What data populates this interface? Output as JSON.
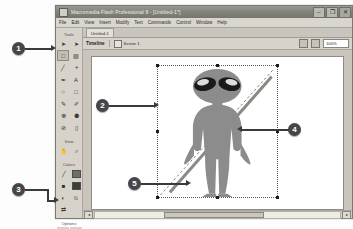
{
  "window": {
    "title": "Macromedia Flash Professional 8 - [Untitled-1*]",
    "app_icon": "flash-app-icon",
    "controls": {
      "minimize": "–",
      "restore": "❐",
      "close": "✕"
    }
  },
  "menubar": {
    "items": [
      {
        "label": "File"
      },
      {
        "label": "Edit"
      },
      {
        "label": "View"
      },
      {
        "label": "Insert"
      },
      {
        "label": "Modify"
      },
      {
        "label": "Text"
      },
      {
        "label": "Commands"
      },
      {
        "label": "Control"
      },
      {
        "label": "Window"
      },
      {
        "label": "Help"
      }
    ]
  },
  "tools_panel": {
    "sections": [
      {
        "label": "Tools",
        "tools": [
          {
            "name": "selection-tool",
            "glyph": "➤",
            "selected": false
          },
          {
            "name": "subselection-tool",
            "glyph": "➤",
            "selected": false
          },
          {
            "name": "free-transform-tool",
            "glyph": "□",
            "selected": true
          },
          {
            "name": "gradient-transform-tool",
            "glyph": "▨",
            "selected": false
          },
          {
            "name": "line-tool",
            "glyph": "╱",
            "selected": false
          },
          {
            "name": "lasso-tool",
            "glyph": "ⰰ",
            "selected": false
          },
          {
            "name": "pen-tool",
            "glyph": "✒",
            "selected": false
          },
          {
            "name": "text-tool",
            "glyph": "A",
            "selected": false
          },
          {
            "name": "oval-tool",
            "glyph": "○",
            "selected": false
          },
          {
            "name": "rectangle-tool",
            "glyph": "□",
            "selected": false
          },
          {
            "name": "pencil-tool",
            "glyph": "✎",
            "selected": false
          },
          {
            "name": "brush-tool",
            "glyph": "✐",
            "selected": false
          },
          {
            "name": "ink-bottle-tool",
            "glyph": "☸",
            "selected": false
          },
          {
            "name": "paint-bucket-tool",
            "glyph": "⚉",
            "selected": false
          },
          {
            "name": "eyedropper-tool",
            "glyph": "⊘",
            "selected": false
          },
          {
            "name": "eraser-tool",
            "glyph": "▯",
            "selected": false
          }
        ]
      },
      {
        "label": "View",
        "tools": [
          {
            "name": "hand-tool",
            "glyph": "✋",
            "selected": false
          },
          {
            "name": "zoom-tool",
            "glyph": "⌕",
            "selected": false
          }
        ]
      },
      {
        "label": "Colors",
        "tools": [
          {
            "name": "stroke-color-pencil-icon",
            "glyph": "╱",
            "selected": false
          },
          {
            "name": "fill-color-bucket-icon",
            "glyph": "■",
            "selected": false
          },
          {
            "name": "black-and-white-icon",
            "glyph": "◐",
            "selected": false
          },
          {
            "name": "no-color-icon",
            "glyph": "⍉",
            "selected": false
          },
          {
            "name": "swap-colors-icon",
            "glyph": "⇄",
            "selected": false
          }
        ]
      },
      {
        "label": "Options",
        "tools": [
          {
            "name": "snap-to-objects-option",
            "glyph": "⬚",
            "selected": false
          },
          {
            "name": "rotate-and-skew-option",
            "glyph": "↻",
            "selected": false
          },
          {
            "name": "scale-option",
            "glyph": "⬌",
            "selected": false
          },
          {
            "name": "distort-option",
            "glyph": "◱",
            "selected": false
          },
          {
            "name": "envelope-option",
            "glyph": "▦",
            "selected": false
          }
        ]
      }
    ],
    "colors": {
      "stroke": "#6f6f69",
      "fill": "#3d3d39"
    }
  },
  "document": {
    "tab_label": "Untitled-1",
    "timeline_label": "Timeline",
    "scene_label": "Scene 1",
    "scene_icon": "scene-icon",
    "edit_scene_icon": "edit-scene-icon",
    "edit_symbols_icon": "edit-symbols-icon",
    "zoom_value": "100%"
  },
  "stage": {
    "selected_object": "alien-character",
    "alien_body_color": "#8c8c8c",
    "alien_eye_color": "#1a1a1a",
    "selection_border_color": "#5a5a55",
    "handle_color": "#1c1c1a"
  },
  "scrollbar": {
    "left_arrow": "◂",
    "right_arrow": "▸"
  },
  "callouts": [
    {
      "number": "1",
      "target": "tools-panel-top"
    },
    {
      "number": "2",
      "target": "selected-alien-object"
    },
    {
      "number": "3",
      "target": "tools-panel-options"
    },
    {
      "number": "4",
      "target": "selection-right-edge"
    },
    {
      "number": "5",
      "target": "transform-corner-handle"
    }
  ],
  "accent": {
    "callout_fill": "#46464a",
    "callout_text": "#ffffff",
    "leader_line": "#3a3a3e"
  }
}
